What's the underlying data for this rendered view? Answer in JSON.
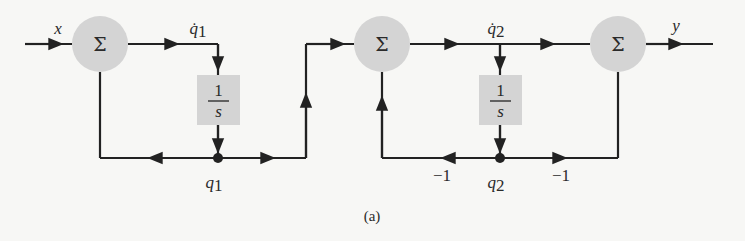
{
  "diagram": {
    "caption": "(a)",
    "colors": {
      "line": "#222222",
      "summer_fill": "#d4d4d4",
      "block_fill": "#d4d4d4",
      "background": "#f7f7f5"
    },
    "summers": [
      {
        "id": "sum1",
        "symbol": "Σ"
      },
      {
        "id": "sum2",
        "symbol": "Σ"
      },
      {
        "id": "sum3",
        "symbol": "Σ"
      }
    ],
    "integrators": [
      {
        "id": "int1",
        "numerator": "1",
        "denominator": "s"
      },
      {
        "id": "int2",
        "numerator": "1",
        "denominator": "s"
      }
    ],
    "signals": {
      "input": "x",
      "output": "y",
      "q1_dot": "q̇",
      "q1_dot_sub": "1",
      "q1": "q",
      "q1_sub": "1",
      "q2_dot": "q̇",
      "q2_dot_sub": "2",
      "q2": "q",
      "q2_sub": "2"
    },
    "gains": {
      "feedback_sum2": "−1",
      "feedback_sum3": "−1"
    }
  }
}
